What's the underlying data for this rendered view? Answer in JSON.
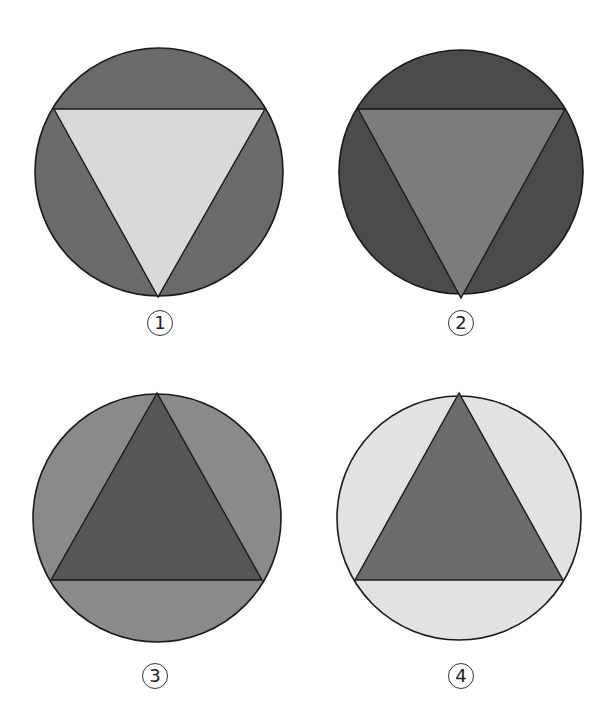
{
  "figures": [
    {
      "label": "1",
      "circle": {
        "cx": 159,
        "cy": 172,
        "r": 124,
        "fill": "#6a6a6a"
      },
      "triangle": {
        "orientation": "down",
        "points": "54,109 265,109 158,297",
        "fill": "#d9d9d9"
      },
      "label_pos": {
        "x": 160,
        "y": 323
      }
    },
    {
      "label": "2",
      "circle": {
        "cx": 461,
        "cy": 172,
        "r": 122,
        "fill": "#4b4b4b"
      },
      "triangle": {
        "orientation": "down",
        "points": "358,109 565,109 461,298",
        "fill": "#7c7c7c"
      },
      "label_pos": {
        "x": 461,
        "y": 323
      }
    },
    {
      "label": "3",
      "circle": {
        "cx": 157,
        "cy": 518,
        "r": 124,
        "fill": "#8a8a8a"
      },
      "triangle": {
        "orientation": "up",
        "points": "157,393 51,580 262,580",
        "fill": "#565656"
      },
      "label_pos": {
        "x": 155,
        "y": 676
      }
    },
    {
      "label": "4",
      "circle": {
        "cx": 459,
        "cy": 518,
        "r": 122,
        "fill": "#e2e2e2"
      },
      "triangle": {
        "orientation": "up",
        "points": "459,393 355,580 563,580",
        "fill": "#6b6b6b"
      },
      "label_pos": {
        "x": 461,
        "y": 676
      }
    }
  ],
  "stroke_color": "#1a1a1a"
}
